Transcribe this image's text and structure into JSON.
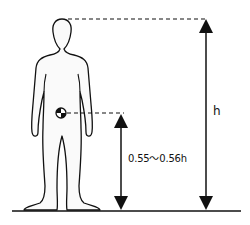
{
  "diagram": {
    "title": "",
    "labels": {
      "height": "h",
      "center_of_mass_height": "0.55〜0.56h"
    },
    "elements": [
      {
        "name": "human-silhouette",
        "type": "figure"
      },
      {
        "name": "center-of-mass-marker",
        "type": "symbol"
      },
      {
        "name": "total-height-arrow",
        "label": "h"
      },
      {
        "name": "com-height-arrow",
        "label": "0.55〜0.56h"
      },
      {
        "name": "ground-line",
        "type": "line"
      }
    ],
    "colors": {
      "stroke": "#111111",
      "fill": "#ffffff"
    }
  }
}
